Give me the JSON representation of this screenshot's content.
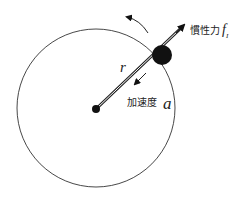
{
  "diagram": {
    "radius_label": "r",
    "acceleration_label": "加速度",
    "acceleration_symbol": "a",
    "inertial_force_label": "慣性力",
    "inertial_force_symbol": "f",
    "inertial_force_subscript": "I",
    "colors": {
      "stroke": "#222222",
      "fill": "#111111",
      "background": "#ffffff"
    }
  }
}
